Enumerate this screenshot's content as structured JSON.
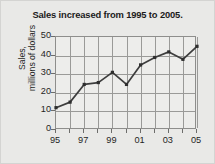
{
  "chart_data": {
    "type": "line",
    "title": "Sales increased from 1995 to 2005.",
    "xlabel": "",
    "ylabel": "Sales, millions of dollars",
    "ylabel_line1": "Sales,",
    "ylabel_line2": "millions of dollars",
    "x": [
      "95",
      "96",
      "97",
      "98",
      "99",
      "00",
      "01",
      "02",
      "03",
      "04",
      "05"
    ],
    "categories": [
      "95",
      "96",
      "97",
      "98",
      "99",
      "00",
      "01",
      "02",
      "03",
      "04",
      "05"
    ],
    "values": [
      12,
      15,
      24.5,
      25.5,
      31,
      24.5,
      35,
      39,
      42,
      38,
      45
    ],
    "series": [
      {
        "name": "Sales",
        "values": [
          12,
          15,
          24.5,
          25.5,
          31,
          24.5,
          35,
          39,
          42,
          38,
          45
        ]
      }
    ],
    "xlim": [
      0,
      10
    ],
    "ylim": [
      0,
      50
    ],
    "yticks": [
      0,
      10,
      20,
      30,
      40,
      50
    ],
    "ytick_labels": [
      "0",
      "10",
      "20",
      "30",
      "40",
      "50"
    ],
    "xtick_labels": [
      "95",
      "97",
      "99",
      "01",
      "03",
      "05"
    ],
    "xtick_positions": [
      0,
      2,
      4,
      6,
      8,
      10
    ],
    "grid": true,
    "legend": "none",
    "line_color": "#3d3d3d",
    "marker_color": "#2e2e2e",
    "grid_color": "#9a9a98",
    "axis_color": "#8e8e8c",
    "plot_background": "#ededeb",
    "figure_background": "#e9e9e7",
    "text_color": "#1f1f1f"
  }
}
